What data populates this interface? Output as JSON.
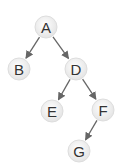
{
  "diagram": {
    "type": "binary-tree",
    "nodes": [
      {
        "id": "A",
        "label": "A",
        "x": 46,
        "y": 27
      },
      {
        "id": "B",
        "label": "B",
        "x": 19,
        "y": 69
      },
      {
        "id": "D",
        "label": "D",
        "x": 76,
        "y": 69
      },
      {
        "id": "E",
        "label": "E",
        "x": 52,
        "y": 111
      },
      {
        "id": "F",
        "label": "F",
        "x": 103,
        "y": 110
      },
      {
        "id": "G",
        "label": "G",
        "x": 79,
        "y": 151
      }
    ],
    "edges": [
      {
        "from": "A",
        "to": "B"
      },
      {
        "from": "A",
        "to": "D"
      },
      {
        "from": "D",
        "to": "E"
      },
      {
        "from": "D",
        "to": "F"
      },
      {
        "from": "F",
        "to": "G"
      }
    ],
    "colors": {
      "node_fill": "#eeeeee",
      "node_edge": "#dddddd",
      "edge": "#666666",
      "text": "#333333"
    }
  }
}
